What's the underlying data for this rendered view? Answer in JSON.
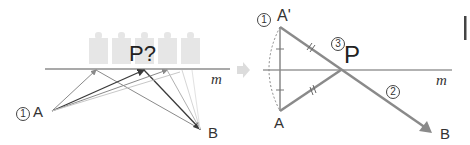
{
  "left_panel": {
    "step_marker": "1",
    "point_a": "A",
    "point_b": "B",
    "line_label": "m",
    "question_label": "P?",
    "buildings_count": 5
  },
  "transition_arrow": "right-arrow",
  "right_panel": {
    "step1_marker": "1",
    "reflected_point": "A'",
    "point_a": "A",
    "step3_marker": "3",
    "point_p": "P",
    "step2_marker": "2",
    "line_label": "m",
    "point_b": "B"
  },
  "colors": {
    "line": "#555555",
    "path_gray": "#8a8a8a",
    "path_dark": "#3a3a3a",
    "path_light": "#c8c8c8",
    "building": "#e4e4e4",
    "arrow": "#dcdcdc",
    "text": "#333333"
  }
}
